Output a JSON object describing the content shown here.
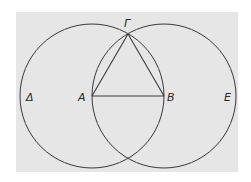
{
  "diagram": {
    "title": "",
    "background": "#e6e6e6",
    "stroke_color": "#3a3a3a",
    "points": {
      "A": {
        "label": "A",
        "x": 92,
        "y": 96
      },
      "B": {
        "label": "B",
        "x": 164,
        "y": 96
      },
      "G": {
        "label": "Γ",
        "x": 128,
        "y": 34
      }
    },
    "circle_labels": {
      "left": "Δ",
      "right": "E"
    },
    "circles": [
      {
        "name": "circle-centered-A",
        "cx": 92,
        "cy": 96,
        "r": 72
      },
      {
        "name": "circle-centered-B",
        "cx": 164,
        "cy": 96,
        "r": 72
      }
    ],
    "segments": [
      {
        "name": "segment-AB",
        "from": "A",
        "to": "B"
      },
      {
        "name": "segment-AΓ",
        "from": "A",
        "to": "G"
      },
      {
        "name": "segment-BΓ",
        "from": "B",
        "to": "G"
      }
    ]
  }
}
